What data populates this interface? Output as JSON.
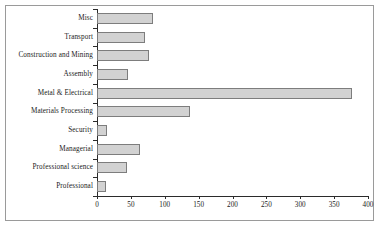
{
  "chart_data": {
    "type": "bar",
    "orientation": "horizontal",
    "title": "",
    "xlabel": "",
    "ylabel": "",
    "categories": [
      "Misc",
      "Transport",
      "Construction and Mining",
      "Assembly",
      "Metal & Electrical",
      "Materials Processing",
      "Security",
      "Managerial",
      "Professional science",
      "Professional"
    ],
    "values": [
      83,
      71,
      77,
      46,
      376,
      137,
      15,
      63,
      44,
      13
    ],
    "xlim": [
      0,
      400
    ],
    "xticks": [
      0,
      50,
      100,
      150,
      200,
      250,
      300,
      350,
      400
    ],
    "xtick_labels": [
      "0",
      "50",
      "100",
      "150",
      "200",
      "250",
      "300",
      "350",
      "400"
    ],
    "grid": false,
    "legend": null,
    "bar_fill_color": "#d2d2d2",
    "bar_border_color": "#7d7d7d",
    "axis_color": "#2b2b2b",
    "frame_color": "#9a9a9a",
    "background_color": "#ffffff"
  }
}
